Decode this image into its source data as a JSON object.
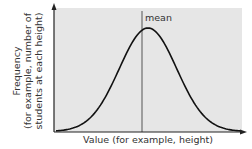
{
  "chart_data": {
    "type": "line",
    "title": "",
    "xlabel": "Value (for example, height)",
    "ylabel_lines": [
      "Frequency",
      "(for example, number of",
      "students at each height)"
    ],
    "annotations": [
      {
        "text": "mean",
        "position": "vertical line at curve peak"
      }
    ],
    "curve": "normal distribution (bell curve)",
    "mean": 0,
    "std_dev": 1,
    "x": [
      -3.2,
      -3,
      -2.5,
      -2,
      -1.5,
      -1,
      -0.5,
      0,
      0.5,
      1,
      1.5,
      2,
      2.5,
      3,
      3.2
    ],
    "y": [
      0.002,
      0.004,
      0.018,
      0.054,
      0.13,
      0.242,
      0.352,
      0.399,
      0.352,
      0.242,
      0.13,
      0.054,
      0.018,
      0.004,
      0.002
    ],
    "xlim": [
      -3.3,
      3.3
    ],
    "ylim": [
      0,
      0.5
    ],
    "grid": false,
    "legend": null,
    "ticks": "none"
  },
  "colors": {
    "plot_background": "#e6e6e6",
    "curve": "#111111",
    "axis": "#222222",
    "mean_line": "#555555",
    "text": "#333333"
  },
  "labels": {
    "mean": "mean",
    "xaxis": "Value (for example, height)",
    "yaxis_line1": "Frequency",
    "yaxis_line2": "(for example, number of",
    "yaxis_line3": "students at each height)"
  }
}
